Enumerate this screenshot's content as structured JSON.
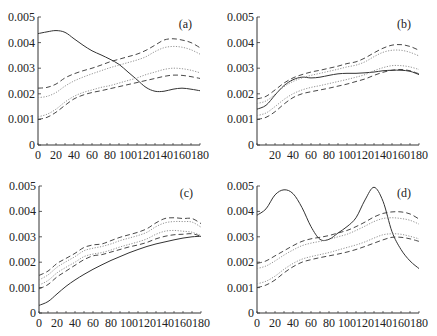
{
  "chart_data": [
    {
      "type": "line",
      "panel_label": "(a)",
      "title": "",
      "xlabel": "",
      "ylabel": "",
      "xlim": [
        0,
        180
      ],
      "ylim": [
        0,
        0.005
      ],
      "xticks": [
        "0",
        "20",
        "40",
        "60",
        "80",
        "100",
        "120",
        "140",
        "160",
        "180"
      ],
      "yticks": [
        "0",
        "0.001",
        "0.002",
        "0.003",
        "0.004",
        "0.005"
      ],
      "grid": false,
      "x": [
        0,
        10,
        20,
        30,
        40,
        50,
        60,
        70,
        80,
        90,
        100,
        110,
        120,
        130,
        140,
        150,
        160,
        170,
        180
      ],
      "series": [
        {
          "name": "estimate",
          "style": "solid",
          "values": [
            0.00435,
            0.00442,
            0.00447,
            0.0044,
            0.00415,
            0.0039,
            0.00368,
            0.00352,
            0.00335,
            0.00315,
            0.00285,
            0.00255,
            0.00225,
            0.0021,
            0.0021,
            0.00218,
            0.00222,
            0.00218,
            0.00212
          ]
        },
        {
          "name": "upper outer band",
          "style": "dashed",
          "values": [
            0.00222,
            0.00225,
            0.00238,
            0.00262,
            0.00278,
            0.0029,
            0.003,
            0.00312,
            0.00325,
            0.00335,
            0.00345,
            0.00355,
            0.0037,
            0.0039,
            0.0041,
            0.00415,
            0.0041,
            0.004,
            0.0038
          ]
        },
        {
          "name": "upper inner band",
          "style": "dotted",
          "values": [
            0.00185,
            0.0019,
            0.00205,
            0.0023,
            0.0025,
            0.00265,
            0.00278,
            0.0029,
            0.00302,
            0.00312,
            0.00322,
            0.00332,
            0.00345,
            0.00365,
            0.0038,
            0.00385,
            0.00382,
            0.00372,
            0.00355
          ]
        },
        {
          "name": "lower inner band",
          "style": "dotted",
          "values": [
            0.0011,
            0.0012,
            0.0014,
            0.00168,
            0.0019,
            0.00205,
            0.00215,
            0.00225,
            0.00232,
            0.00242,
            0.00252,
            0.00262,
            0.00275,
            0.00285,
            0.00295,
            0.003,
            0.00298,
            0.00292,
            0.00282
          ]
        },
        {
          "name": "lower outer band",
          "style": "dashed",
          "values": [
            0.001,
            0.00108,
            0.00128,
            0.00155,
            0.0018,
            0.00195,
            0.00205,
            0.00212,
            0.0022,
            0.00228,
            0.00236,
            0.00244,
            0.00252,
            0.0026,
            0.00268,
            0.00273,
            0.00272,
            0.00267,
            0.0026
          ]
        }
      ]
    },
    {
      "type": "line",
      "panel_label": "(b)",
      "title": "",
      "xlabel": "",
      "ylabel": "",
      "xlim": [
        0,
        180
      ],
      "ylim": [
        0,
        0.005
      ],
      "xticks": [
        "20",
        "40",
        "60",
        "80",
        "100",
        "120",
        "140",
        "160",
        "180"
      ],
      "yticks": [
        "0",
        "0.001",
        "0.002",
        "0.003",
        "0.004",
        "0.005"
      ],
      "grid": false,
      "x": [
        0,
        10,
        20,
        30,
        40,
        50,
        60,
        70,
        80,
        90,
        100,
        110,
        120,
        130,
        140,
        150,
        160,
        170,
        180
      ],
      "series": [
        {
          "name": "estimate",
          "style": "solid",
          "values": [
            0.0014,
            0.00155,
            0.00195,
            0.00232,
            0.00255,
            0.00265,
            0.00262,
            0.00265,
            0.00272,
            0.00278,
            0.0028,
            0.0028,
            0.00282,
            0.00285,
            0.0029,
            0.00292,
            0.00292,
            0.00288,
            0.00275
          ]
        },
        {
          "name": "upper outer band",
          "style": "dashed",
          "values": [
            0.0018,
            0.0019,
            0.00215,
            0.00242,
            0.00262,
            0.00275,
            0.00285,
            0.00292,
            0.003,
            0.00308,
            0.00318,
            0.00325,
            0.0034,
            0.0036,
            0.00378,
            0.0039,
            0.00392,
            0.00385,
            0.0037
          ]
        },
        {
          "name": "upper inner band",
          "style": "dotted",
          "values": [
            0.00162,
            0.00172,
            0.00198,
            0.00228,
            0.00248,
            0.00262,
            0.00272,
            0.0028,
            0.00288,
            0.00296,
            0.00305,
            0.00312,
            0.00325,
            0.00345,
            0.00362,
            0.0037,
            0.0037,
            0.00362,
            0.00348
          ]
        },
        {
          "name": "lower inner band",
          "style": "dotted",
          "values": [
            0.00115,
            0.00125,
            0.0015,
            0.00178,
            0.002,
            0.00215,
            0.00225,
            0.00232,
            0.0024,
            0.00248,
            0.00256,
            0.00265,
            0.00275,
            0.0029,
            0.00302,
            0.0031,
            0.0031,
            0.00305,
            0.00295
          ]
        },
        {
          "name": "lower outer band",
          "style": "dashed",
          "values": [
            0.001,
            0.00108,
            0.0013,
            0.0016,
            0.00185,
            0.002,
            0.00208,
            0.00215,
            0.00222,
            0.0023,
            0.00238,
            0.00248,
            0.00258,
            0.00272,
            0.00284,
            0.00292,
            0.00295,
            0.0029,
            0.00278
          ]
        }
      ]
    },
    {
      "type": "line",
      "panel_label": "(c)",
      "title": "",
      "xlabel": "",
      "ylabel": "",
      "xlim": [
        0,
        180
      ],
      "ylim": [
        0,
        0.005
      ],
      "xticks": [
        "0",
        "20",
        "40",
        "60",
        "80",
        "100",
        "120",
        "140",
        "160",
        "180"
      ],
      "yticks": [
        "0",
        "0.001",
        "0.002",
        "0.003",
        "0.004",
        "0.005"
      ],
      "grid": false,
      "x": [
        0,
        10,
        20,
        30,
        40,
        50,
        60,
        70,
        80,
        90,
        100,
        110,
        120,
        130,
        140,
        150,
        160,
        170,
        180
      ],
      "series": [
        {
          "name": "estimate",
          "style": "solid",
          "values": [
            0.0003,
            0.00045,
            0.00075,
            0.00105,
            0.0013,
            0.00152,
            0.00172,
            0.0019,
            0.00207,
            0.00222,
            0.00237,
            0.0025,
            0.00262,
            0.00272,
            0.0028,
            0.00288,
            0.00295,
            0.003,
            0.00302
          ]
        },
        {
          "name": "upper outer band",
          "style": "dashed",
          "values": [
            0.00148,
            0.00165,
            0.00195,
            0.00215,
            0.00235,
            0.00258,
            0.00268,
            0.00272,
            0.00285,
            0.00298,
            0.00308,
            0.00318,
            0.00332,
            0.00355,
            0.00372,
            0.00375,
            0.00372,
            0.00372,
            0.00352
          ]
        },
        {
          "name": "upper inner band",
          "style": "dotted",
          "values": [
            0.0013,
            0.0015,
            0.0018,
            0.00202,
            0.00222,
            0.00245,
            0.00255,
            0.00262,
            0.00272,
            0.00285,
            0.00295,
            0.00305,
            0.00318,
            0.0034,
            0.00355,
            0.0036,
            0.0036,
            0.00358,
            0.00338
          ]
        },
        {
          "name": "lower inner band",
          "style": "dotted",
          "values": [
            0.0011,
            0.00128,
            0.00158,
            0.0018,
            0.002,
            0.00222,
            0.00232,
            0.00238,
            0.00248,
            0.0026,
            0.0027,
            0.0028,
            0.00292,
            0.0031,
            0.00322,
            0.00325,
            0.00322,
            0.00318,
            0.00305
          ]
        },
        {
          "name": "lower outer band",
          "style": "dashed",
          "values": [
            0.00095,
            0.00112,
            0.00142,
            0.00165,
            0.00188,
            0.0021,
            0.00225,
            0.0023,
            0.0024,
            0.0025,
            0.0026,
            0.00268,
            0.00278,
            0.00292,
            0.00302,
            0.00308,
            0.0031,
            0.00312,
            0.00302
          ]
        }
      ]
    },
    {
      "type": "line",
      "panel_label": "(d)",
      "title": "",
      "xlabel": "",
      "ylabel": "",
      "xlim": [
        0,
        180
      ],
      "ylim": [
        0,
        0.005
      ],
      "xticks": [
        "0",
        "20",
        "40",
        "60",
        "80",
        "100",
        "120",
        "140",
        "160",
        "180"
      ],
      "yticks": [
        "0",
        "0.001",
        "0.002",
        "0.003",
        "0.004",
        "0.005"
      ],
      "grid": false,
      "x": [
        0,
        10,
        20,
        30,
        40,
        50,
        60,
        70,
        80,
        90,
        100,
        110,
        120,
        130,
        140,
        150,
        160,
        170,
        180
      ],
      "series": [
        {
          "name": "estimate",
          "style": "solid",
          "values": [
            0.00385,
            0.0041,
            0.00465,
            0.00485,
            0.0047,
            0.00415,
            0.0034,
            0.0029,
            0.0029,
            0.00315,
            0.0034,
            0.00375,
            0.00445,
            0.00495,
            0.0044,
            0.0032,
            0.0025,
            0.00205,
            0.00175
          ]
        },
        {
          "name": "upper outer band",
          "style": "dashed",
          "values": [
            0.00195,
            0.00205,
            0.00225,
            0.00245,
            0.00265,
            0.00282,
            0.00292,
            0.00298,
            0.00305,
            0.00315,
            0.00325,
            0.0034,
            0.00358,
            0.00378,
            0.00392,
            0.00398,
            0.00398,
            0.0039,
            0.0037
          ]
        },
        {
          "name": "upper inner band",
          "style": "dotted",
          "values": [
            0.00175,
            0.00185,
            0.00205,
            0.00228,
            0.00248,
            0.00265,
            0.00275,
            0.00282,
            0.0029,
            0.003,
            0.0031,
            0.00325,
            0.00342,
            0.0036,
            0.00372,
            0.00375,
            0.00372,
            0.00365,
            0.0035
          ]
        },
        {
          "name": "lower inner band",
          "style": "dotted",
          "values": [
            0.00115,
            0.00125,
            0.00145,
            0.00172,
            0.00195,
            0.00212,
            0.00222,
            0.0023,
            0.00238,
            0.00248,
            0.00258,
            0.00268,
            0.0028,
            0.00295,
            0.00308,
            0.00312,
            0.0031,
            0.00302,
            0.00292
          ]
        },
        {
          "name": "lower outer band",
          "style": "dashed",
          "values": [
            0.001,
            0.0011,
            0.0013,
            0.00158,
            0.00182,
            0.002,
            0.0021,
            0.00218,
            0.00225,
            0.00232,
            0.0024,
            0.0025,
            0.00262,
            0.00275,
            0.00288,
            0.00298,
            0.00298,
            0.00292,
            0.00282
          ]
        }
      ]
    }
  ],
  "panels": [
    {
      "id": "a",
      "left": 38,
      "right": 200,
      "top": 17,
      "bottom": 145
    },
    {
      "id": "b",
      "left": 257,
      "right": 419,
      "top": 17,
      "bottom": 145
    },
    {
      "id": "c",
      "left": 39,
      "right": 201,
      "top": 186,
      "bottom": 313
    },
    {
      "id": "d",
      "left": 257,
      "right": 419,
      "top": 186,
      "bottom": 313
    }
  ],
  "styles": {
    "solid": {
      "stroke": "#333333",
      "dash": ""
    },
    "dashed": {
      "stroke": "#333333",
      "dash": "5,3"
    },
    "dotted": {
      "stroke": "#888888",
      "dash": "1.2,1.5"
    }
  }
}
